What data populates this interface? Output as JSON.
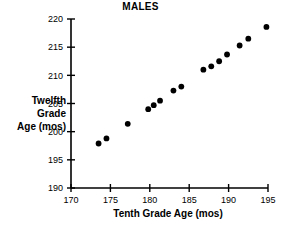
{
  "chart_data": {
    "type": "scatter",
    "title": "MALES",
    "xlabel": "Tenth Grade Age (mos)",
    "ylabel": "Twelfth Grade Age (mos)",
    "ylabel_lines": [
      "Twelfth",
      "Grade",
      "Age (mos)"
    ],
    "xlim": [
      170,
      195
    ],
    "ylim": [
      190,
      220
    ],
    "xticks": [
      170,
      175,
      180,
      185,
      190,
      195
    ],
    "yticks": [
      190,
      195,
      200,
      205,
      210,
      215,
      220
    ],
    "xtick_labels": [
      "170",
      "175",
      "180",
      "185",
      "190",
      "195"
    ],
    "ytick_labels": [
      "190",
      "195",
      "200",
      "205",
      "210",
      "215",
      "220"
    ],
    "grid": false,
    "legend": null,
    "marker": "filled-circle",
    "marker_color": "#000000",
    "points": [
      {
        "x": 173.5,
        "y": 197.9
      },
      {
        "x": 174.5,
        "y": 198.8
      },
      {
        "x": 177.2,
        "y": 201.4
      },
      {
        "x": 179.8,
        "y": 204.0
      },
      {
        "x": 180.5,
        "y": 204.7
      },
      {
        "x": 181.3,
        "y": 205.5
      },
      {
        "x": 183.0,
        "y": 207.3
      },
      {
        "x": 184.0,
        "y": 208.0
      },
      {
        "x": 186.8,
        "y": 211.0
      },
      {
        "x": 187.8,
        "y": 211.6
      },
      {
        "x": 188.8,
        "y": 212.5
      },
      {
        "x": 189.8,
        "y": 213.7
      },
      {
        "x": 191.4,
        "y": 215.3
      },
      {
        "x": 192.5,
        "y": 216.5
      },
      {
        "x": 194.8,
        "y": 218.6
      }
    ]
  },
  "axes": {
    "axis_color": "#000000",
    "plot_left_px": 71,
    "plot_right_px": 268,
    "plot_top_px": 19,
    "plot_bottom_px": 188
  }
}
